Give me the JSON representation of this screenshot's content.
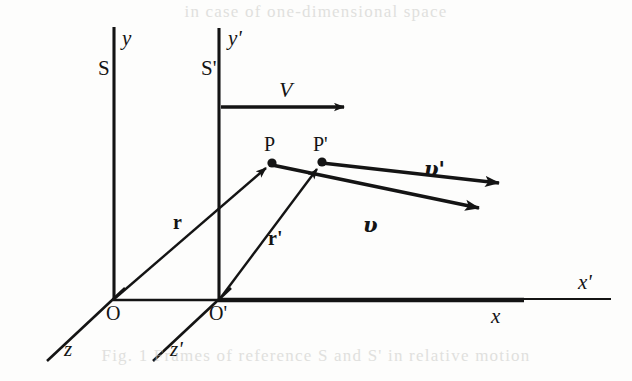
{
  "figure": {
    "kind": "physics-diagram",
    "background_color": "#fdfdfc",
    "ink_color": "#141414",
    "bleed_color": "#c9c9c6"
  },
  "bleed_text": {
    "top": "in   case  of  one-dimensional   space",
    "bottom": "Fig. 1  Frames of reference   S and S' in relative motion"
  },
  "frames": [
    {
      "id": "S",
      "label": "S",
      "x": 98,
      "y": 58
    },
    {
      "id": "Sprime",
      "label": "S'",
      "x": 201,
      "y": 58
    }
  ],
  "axes": [
    {
      "id": "y-axis",
      "label": "y",
      "x": 122,
      "y": 28,
      "italic": true
    },
    {
      "id": "yprime-axis",
      "label": "y'",
      "x": 228,
      "y": 28,
      "italic": true
    },
    {
      "id": "x-axis",
      "label": "x",
      "x": 491,
      "y": 306,
      "italic": true
    },
    {
      "id": "xprime-axis",
      "label": "x'",
      "x": 578,
      "y": 272,
      "italic": true
    },
    {
      "id": "z-axis",
      "label": "z",
      "x": 64,
      "y": 339,
      "italic": true
    },
    {
      "id": "zprime-axis",
      "label": "z'",
      "x": 170,
      "y": 339,
      "italic": true
    }
  ],
  "origins": [
    {
      "id": "O",
      "label": "O",
      "x": 106,
      "y": 303
    },
    {
      "id": "Oprime",
      "label": "O'",
      "x": 209,
      "y": 303
    }
  ],
  "points": [
    {
      "id": "P",
      "label": "P",
      "x": 264,
      "y": 134,
      "dot_x": 272,
      "dot_y": 163
    },
    {
      "id": "Pprime",
      "label": "P'",
      "x": 313,
      "y": 134,
      "dot_x": 322,
      "dot_y": 162
    }
  ],
  "vectors": [
    {
      "id": "r",
      "label": "r",
      "style": "bold",
      "x": 173,
      "y": 212,
      "from": "O",
      "to": "P"
    },
    {
      "id": "r-prime",
      "label": "r'",
      "style": "bold",
      "x": 268,
      "y": 228,
      "from": "O'",
      "to": "P'"
    },
    {
      "id": "V",
      "label": "V",
      "style": "italic",
      "x": 279,
      "y": 79,
      "from": "S' y-axis",
      "to": "right"
    },
    {
      "id": "v",
      "label": "υ",
      "style": "bold-italic",
      "x": 363,
      "y": 214,
      "from": "P",
      "to": "right-down"
    },
    {
      "id": "v-prime",
      "label": "υ'",
      "style": "bold-italic",
      "x": 424,
      "y": 158,
      "from": "P'",
      "to": "right-down"
    }
  ],
  "geometry": {
    "origin_O": [
      113,
      300
    ],
    "origin_Oprime": [
      219,
      300
    ],
    "y_axis_top": [
      114,
      27
    ],
    "yprime_axis_top": [
      219,
      28
    ],
    "x_axis_end_thick": [
      523,
      300
    ],
    "xprime_axis_end": [
      610,
      300
    ],
    "z_axis_end": [
      47,
      361
    ],
    "zprime_axis_end": [
      153,
      361
    ],
    "point_P": [
      272,
      163
    ],
    "point_Pprime": [
      322,
      162
    ],
    "V_arrow": [
      [
        222,
        107
      ],
      [
        354,
        107
      ]
    ],
    "v_arrow": [
      [
        272,
        167
      ],
      [
        492,
        213
      ]
    ],
    "vprime_arrow": [
      [
        322,
        164
      ],
      [
        512,
        186
      ]
    ]
  }
}
